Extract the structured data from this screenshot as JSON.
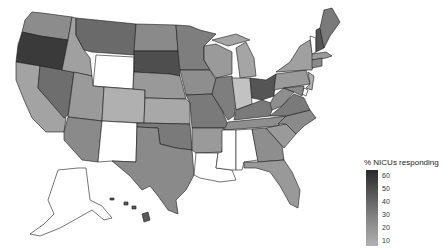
{
  "map": {
    "type": "choropleth",
    "region": "United States",
    "legend": {
      "title": "% NICUs responding",
      "ticks": [
        "60",
        "50",
        "40",
        "30",
        "20",
        "10"
      ],
      "color_low": "#b5b5b5",
      "color_high": "#2a2a2a"
    },
    "states": [
      {
        "name": "Oregon",
        "fill": "#3a3a3a"
      },
      {
        "name": "Washington",
        "fill": "#8c8c8c"
      },
      {
        "name": "California",
        "fill": "#a3a3a3"
      },
      {
        "name": "Nevada",
        "fill": "#6e6e6e"
      },
      {
        "name": "Idaho",
        "fill": "#a0a0a0"
      },
      {
        "name": "Montana",
        "fill": "#6a6a6a"
      },
      {
        "name": "Wyoming",
        "fill": "#ffffff"
      },
      {
        "name": "Utah",
        "fill": "#9a9a9a"
      },
      {
        "name": "Arizona",
        "fill": "#8a8a8a"
      },
      {
        "name": "Colorado",
        "fill": "#b0b0b0"
      },
      {
        "name": "New Mexico",
        "fill": "#ffffff"
      },
      {
        "name": "North Dakota",
        "fill": "#8a8a8a"
      },
      {
        "name": "South Dakota",
        "fill": "#4e4e4e"
      },
      {
        "name": "Nebraska",
        "fill": "#999999"
      },
      {
        "name": "Kansas",
        "fill": "#a8a8a8"
      },
      {
        "name": "Oklahoma",
        "fill": "#7a7a7a"
      },
      {
        "name": "Texas",
        "fill": "#8a8a8a"
      },
      {
        "name": "Minnesota",
        "fill": "#7e7e7e"
      },
      {
        "name": "Iowa",
        "fill": "#8e8e8e"
      },
      {
        "name": "Missouri",
        "fill": "#7a7a7a"
      },
      {
        "name": "Arkansas",
        "fill": "#9a9a9a"
      },
      {
        "name": "Louisiana",
        "fill": "#ffffff"
      },
      {
        "name": "Wisconsin",
        "fill": "#9a9a9a"
      },
      {
        "name": "Illinois",
        "fill": "#7e7e7e"
      },
      {
        "name": "Michigan",
        "fill": "#a5a5a5"
      },
      {
        "name": "Indiana",
        "fill": "#c2c2c2"
      },
      {
        "name": "Ohio",
        "fill": "#555555"
      },
      {
        "name": "Kentucky",
        "fill": "#7a7a7a"
      },
      {
        "name": "Tennessee",
        "fill": "#8e8e8e"
      },
      {
        "name": "Mississippi",
        "fill": "#ffffff"
      },
      {
        "name": "Alabama",
        "fill": "#ffffff"
      },
      {
        "name": "Georgia",
        "fill": "#8e8e8e"
      },
      {
        "name": "Florida",
        "fill": "#999999"
      },
      {
        "name": "South Carolina",
        "fill": "#9a9a9a"
      },
      {
        "name": "North Carolina",
        "fill": "#8a8a8a"
      },
      {
        "name": "Virginia",
        "fill": "#7a7a7a"
      },
      {
        "name": "West Virginia",
        "fill": "#8e8e8e"
      },
      {
        "name": "Pennsylvania",
        "fill": "#9a9a9a"
      },
      {
        "name": "New York",
        "fill": "#a0a0a0"
      },
      {
        "name": "Vermont",
        "fill": "#ffffff"
      },
      {
        "name": "New Hampshire",
        "fill": "#555555"
      },
      {
        "name": "Maine",
        "fill": "#7a7a7a"
      },
      {
        "name": "Massachusetts",
        "fill": "#9a9a9a"
      },
      {
        "name": "Connecticut",
        "fill": "#8a8a8a"
      },
      {
        "name": "New Jersey",
        "fill": "#b0b0b0"
      },
      {
        "name": "Maryland",
        "fill": "#8a8a8a"
      },
      {
        "name": "Delaware",
        "fill": "#ffffff"
      },
      {
        "name": "Alaska",
        "fill": "#ffffff"
      },
      {
        "name": "Hawaii",
        "fill": "#5a5a5a"
      }
    ]
  }
}
